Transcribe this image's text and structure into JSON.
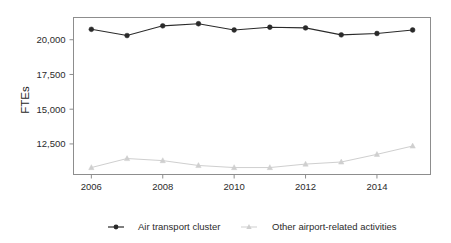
{
  "chart_data": {
    "type": "line",
    "title": "",
    "subtitle": "",
    "xlabel": "",
    "ylabel": "FTEs",
    "x": [
      2006,
      2007,
      2008,
      2009,
      2010,
      2011,
      2012,
      2013,
      2014,
      2015
    ],
    "categories": [
      "2006",
      "2007",
      "2008",
      "2009",
      "2010",
      "2011",
      "2012",
      "2013",
      "2014",
      "2015"
    ],
    "xtick_labels": [
      "2006",
      "2008",
      "2010",
      "2012",
      "2014"
    ],
    "xtick_values": [
      2006,
      2008,
      2010,
      2012,
      2014
    ],
    "ytick_labels": [
      "12,500",
      "15,000",
      "17,500",
      "20,000"
    ],
    "ytick_values": [
      12500,
      15000,
      17500,
      20000
    ],
    "xlim": [
      2005.5,
      2015.5
    ],
    "ylim": [
      10300,
      21600
    ],
    "grid": false,
    "legend_position": "bottom",
    "series": [
      {
        "name": "Air transport cluster",
        "color": "#2a2a2a",
        "marker": "circle",
        "values": [
          20750,
          20300,
          21000,
          21150,
          20700,
          20900,
          20850,
          20350,
          20450,
          20700
        ]
      },
      {
        "name": "Other airport-related activities",
        "color": "#cfcfcf",
        "marker": "triangle",
        "values": [
          10800,
          11450,
          11300,
          10950,
          10800,
          10800,
          11050,
          11200,
          11750,
          12350
        ]
      }
    ],
    "annotations": []
  },
  "legend": {
    "items": [
      {
        "label": "Air transport cluster",
        "marker": "line-circle-marker"
      },
      {
        "label": "Other airport-related activities",
        "marker": "line-triangle-marker"
      }
    ]
  },
  "axis": {
    "y_title": "FTEs"
  },
  "colors": {
    "series_dark": "#2a2a2a",
    "series_light": "#cfcfcf",
    "frame": "#8d8d8d",
    "text": "#2b2b2b",
    "background": "#ffffff"
  }
}
